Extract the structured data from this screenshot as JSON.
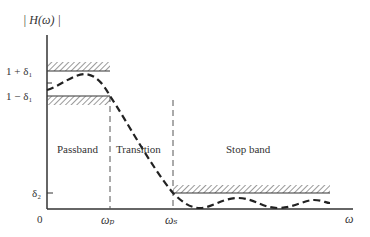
{
  "diagram": {
    "type": "lowpass-filter-tolerance-scheme",
    "y_axis_label": "| H(ω) |",
    "x_axis_label": "ω",
    "origin_label": "0",
    "y_ticks": {
      "upper_passband": "1 + δ₁",
      "lower_passband": "1 − δ₁",
      "stopband": "δ₂"
    },
    "x_ticks": {
      "passband_edge": "ωₚ",
      "stopband_edge": "ωₛ"
    },
    "regions": {
      "passband": "Passband",
      "transition": "Transition",
      "stopband": "Stop band"
    },
    "colors": {
      "line": "#333333",
      "background": "#ffffff"
    }
  }
}
